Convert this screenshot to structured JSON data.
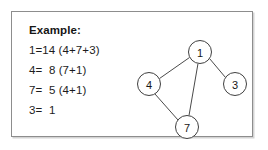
{
  "figure": {
    "background_color": "#ffffff",
    "border_color": "#8d8d8d"
  },
  "example": {
    "heading": "Example:",
    "lines": [
      "1=14 (4+7+3)",
      "4=  8 (7+1)",
      "7=  5 (4+1)",
      "3=  1"
    ]
  },
  "graph": {
    "node_color": "#ffffff",
    "node_stroke": "#3f3f3f",
    "edge_color": "#4a4a4a",
    "nodes": [
      {
        "id": "1",
        "label": "1",
        "cx": 70,
        "cy": 27,
        "r": 11.5
      },
      {
        "id": "4",
        "label": "4",
        "cx": 19,
        "cy": 59,
        "r": 11.5
      },
      {
        "id": "3",
        "label": "3",
        "cx": 105,
        "cy": 59,
        "r": 11.5
      },
      {
        "id": "7",
        "label": "7",
        "cx": 57,
        "cy": 102,
        "r": 11.5
      }
    ],
    "edges": [
      {
        "from": "1",
        "to": "4",
        "x1": 59.5,
        "y1": 32.5,
        "x2": 29.5,
        "y2": 53.5
      },
      {
        "from": "1",
        "to": "3",
        "x1": 79.5,
        "y1": 33.5,
        "x2": 95.5,
        "y2": 52.5
      },
      {
        "from": "1",
        "to": "7",
        "x1": 68.0,
        "y1": 38.5,
        "x2": 59.0,
        "y2": 90.5
      },
      {
        "from": "4",
        "to": "7",
        "x1": 25.0,
        "y1": 69.0,
        "x2": 48.0,
        "y2": 95.0
      }
    ]
  }
}
